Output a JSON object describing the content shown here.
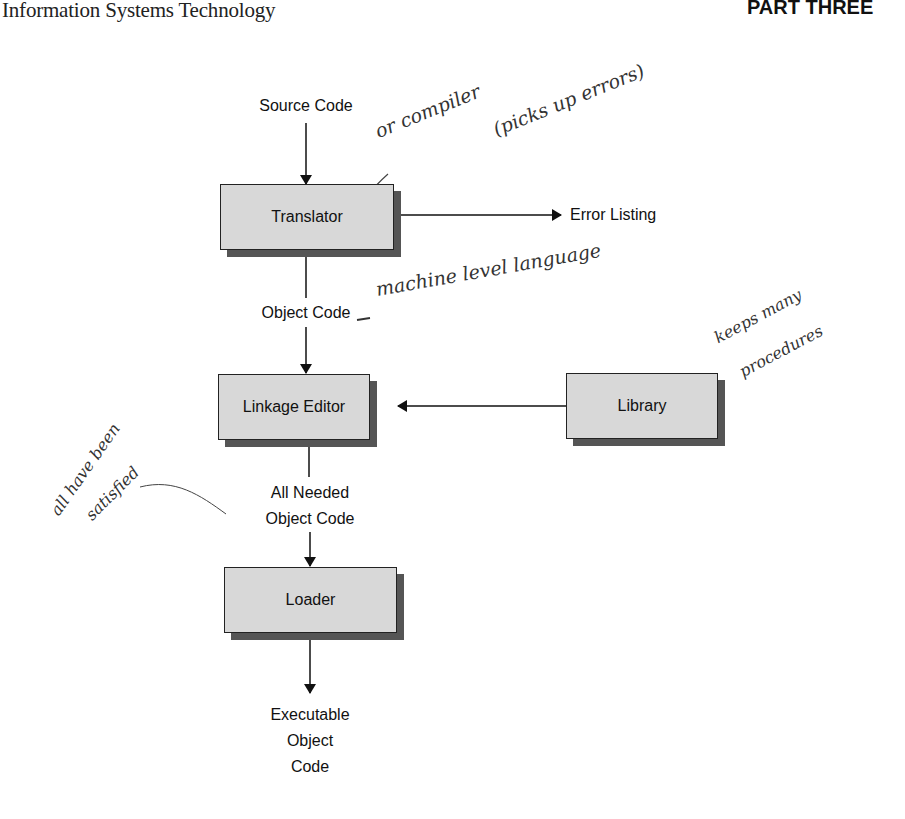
{
  "header": {
    "book_title": "Information Systems Technology",
    "part_label": "PART THREE"
  },
  "diagram": {
    "source_code": "Source Code",
    "translator": "Translator",
    "error_listing": "Error Listing",
    "object_code": "Object Code",
    "linkage_editor": "Linkage Editor",
    "library": "Library",
    "all_needed_line1": "All Needed",
    "all_needed_line2": "Object Code",
    "loader": "Loader",
    "executable_line1": "Executable",
    "executable_line2": "Object",
    "executable_line3": "Code"
  },
  "annotations": {
    "compiler_note": "or compiler",
    "errors_note": "(picks up errors)",
    "machine_note": "machine level language",
    "library_note_1": "keeps many",
    "library_note_2": "procedures",
    "satisfied_note_1": "all have been",
    "satisfied_note_2": "satisfied"
  }
}
